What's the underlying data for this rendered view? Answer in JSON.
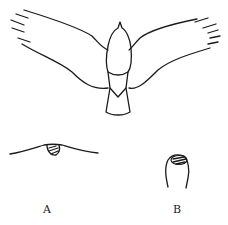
{
  "figure": {
    "main": {
      "subject": "bird-top-view",
      "description": "Outline of a bird with outstretched wings seen from above"
    },
    "panels": [
      {
        "id": "A",
        "label": "A",
        "description": "Low wavy profile with hatched bump"
      },
      {
        "id": "B",
        "label": "B",
        "description": "Tall rounded finger-like profile with hatched tip"
      }
    ],
    "colors": {
      "stroke": "#1a1a1a",
      "background": "#ffffff"
    }
  }
}
